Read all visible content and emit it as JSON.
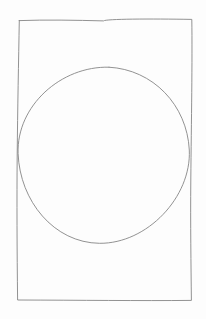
{
  "canvas": {
    "width": 206,
    "height": 319,
    "view_box": "0 0 206 319",
    "background_color": "#fdfdfd"
  },
  "sketch": {
    "stroke_color": "#838383",
    "stroke_width": 1,
    "shapes": [
      {
        "name": "rectangle-outline",
        "type": "rectangle",
        "left": 17,
        "top": 19,
        "right": 192,
        "bottom": 300,
        "path": "M 19.3 20.6 C 46 19.6 76 20.2 103.6 20.9 C 105.5 18.9 150 18.7 191.8 19.4 C 192.4 60 191.4 120 190.8 180 C 190.4 225 191 265 191.4 300.4 C 140 300.9 80 300.2 17.6 300 C 17 250 16.8 200 17.2 155 C 17.6 110 18.6 60 19.3 20.6 Z"
      },
      {
        "name": "circle-outline",
        "type": "ellipse",
        "cx": 103.5,
        "cy": 155,
        "rx": 86,
        "ry": 88,
        "path": "M 109 67.2 C 153 69.5 187 105 189.3 150 C 191.5 197 147 243.8 99.5 243.3 C 54 242.8 19.8 201 18.1 153.5 C 16.4 106 61 65.8 109 67.2"
      }
    ]
  }
}
